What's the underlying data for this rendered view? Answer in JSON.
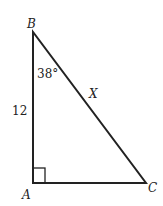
{
  "diagram": {
    "type": "right-triangle",
    "vertices": {
      "A": {
        "label": "A",
        "x": 33,
        "y": 183
      },
      "B": {
        "label": "B",
        "x": 33,
        "y": 32
      },
      "C": {
        "label": "C",
        "x": 146,
        "y": 183
      }
    },
    "angle_B": "38°",
    "side_AB": "12",
    "side_BC": "X",
    "right_angle_at": "A",
    "stroke_color": "#222222"
  }
}
